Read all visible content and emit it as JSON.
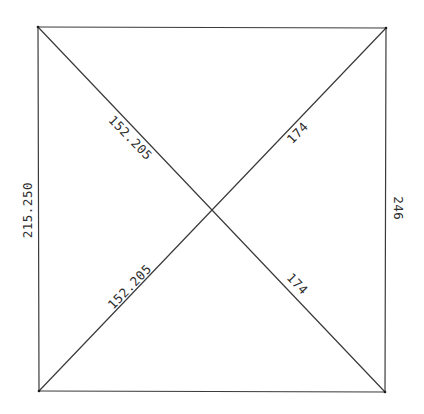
{
  "diagram": {
    "type": "square-with-diagonals",
    "stroke_color": "#3a3a3a",
    "background": "#ffffff",
    "vertices": {
      "top_left": [
        38,
        27
      ],
      "top_right": [
        386,
        28
      ],
      "bottom_left": [
        39,
        391
      ],
      "bottom_right": [
        385,
        392
      ]
    },
    "labels": {
      "left_side": "215.250",
      "right_side": "246",
      "diagonal_upper_left": "152.205",
      "diagonal_lower_left": "152.205",
      "diagonal_upper_right": "174",
      "diagonal_lower_right": "174"
    }
  }
}
